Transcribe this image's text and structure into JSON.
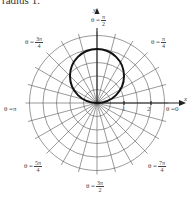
{
  "caption": "radius 1.",
  "diagram": {
    "type": "polar-graph",
    "grid": {
      "circle_spacing_units": 0.5,
      "circle_count": 5,
      "ray_spacing_degrees": 15
    },
    "curve": {
      "description": "circle of radius 1 centered at (0,1), tangent to origin",
      "equation_hint": "r = 2 sin θ",
      "color": "#111111"
    },
    "axes": {
      "x_label": "x",
      "y_label": "y"
    },
    "ticks": [
      "1",
      "2"
    ],
    "angle_labels": {
      "a0": {
        "prefix": "θ = ",
        "text": "0"
      },
      "a90": {
        "prefix": "θ = ",
        "num": "π",
        "den": "2"
      },
      "a45": {
        "prefix": "θ = ",
        "num": "π",
        "den": "4"
      },
      "a135": {
        "prefix": "θ = ",
        "num": "3π",
        "den": "4"
      },
      "a180": {
        "prefix": "θ = ",
        "text": "π"
      },
      "a225": {
        "prefix": "θ = ",
        "num": "5π",
        "den": "4"
      },
      "a270": {
        "prefix": "θ = ",
        "num": "3π",
        "den": "2"
      },
      "a315": {
        "prefix": "θ = ",
        "num": "7π",
        "den": "4"
      }
    },
    "colors": {
      "grid": "#555555",
      "curve": "#111111",
      "axis": "#222222"
    }
  }
}
